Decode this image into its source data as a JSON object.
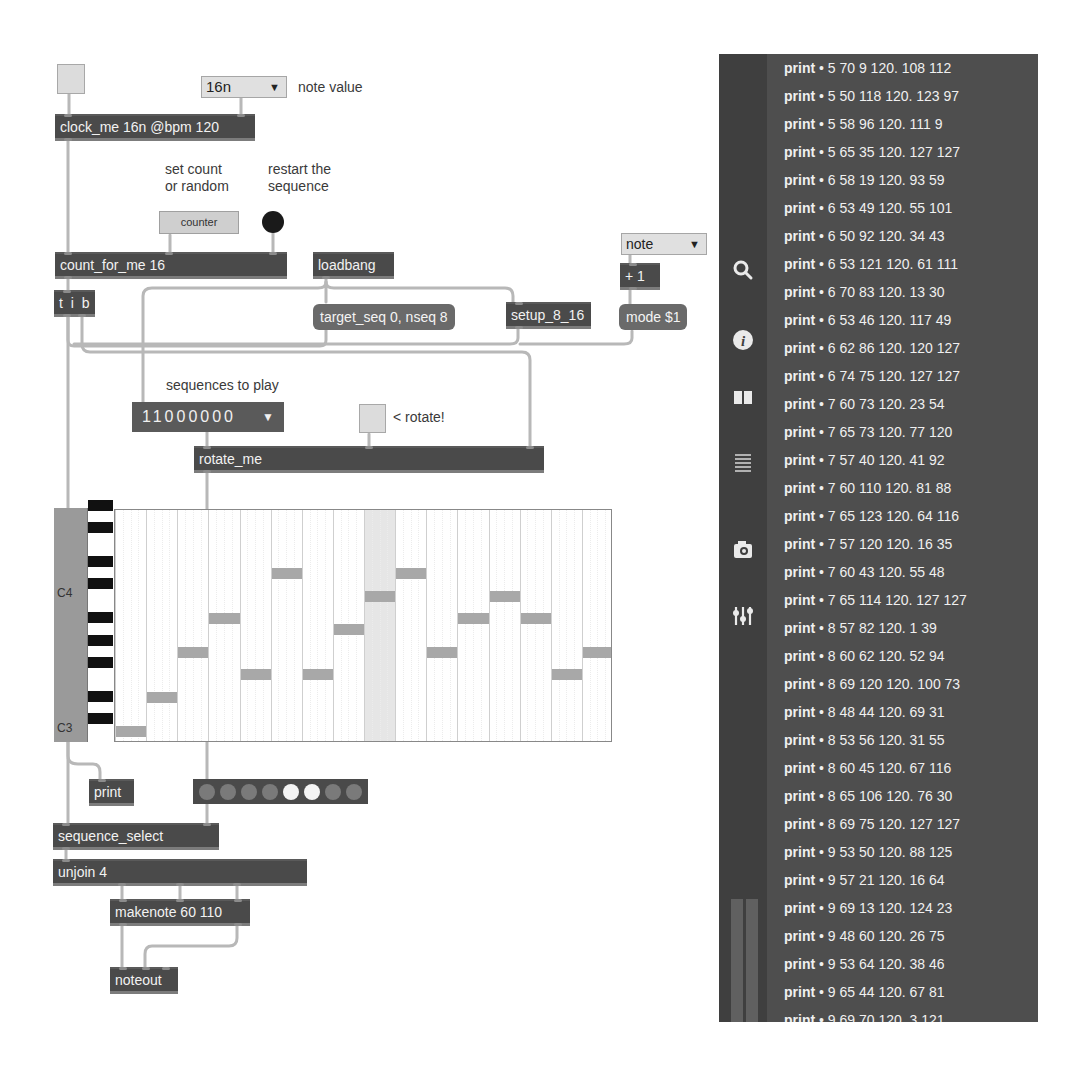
{
  "patch": {
    "toggle_top": {},
    "note_value_menu": {
      "value": "16n",
      "comment": "note value"
    },
    "clock": {
      "text": "clock_me 16n @bpm 120"
    },
    "comments": {
      "set_count": "set count\nor random",
      "set_count_l1": "set count",
      "set_count_l2": "or random",
      "restart_l1": "restart the",
      "restart_l2": "sequence",
      "sequences_to_play": "sequences to play",
      "rotate": "< rotate!"
    },
    "counter_button": {
      "label": "counter"
    },
    "count_for_me": {
      "text": "count_for_me 16"
    },
    "loadbang": {
      "text": "loadbang"
    },
    "mode_menu": {
      "value": "note"
    },
    "plus_one": {
      "text": "+ 1"
    },
    "tib": {
      "text": "t i b"
    },
    "target_seq_msg": {
      "text": "target_seq 0, nseq 8"
    },
    "setup": {
      "text": "setup_8_16"
    },
    "mode_msg": {
      "text": "mode $1"
    },
    "sequences_menu": {
      "value": "11000000"
    },
    "rotate_me": {
      "text": "rotate_me"
    },
    "piano_roll": {
      "label_c4": "C4",
      "label_c3": "C3",
      "columns": 16,
      "highlight_column": 9,
      "notes": [
        48,
        51,
        55,
        58,
        53,
        62,
        53,
        57,
        60,
        62,
        55,
        58,
        60,
        58,
        53,
        55
      ]
    },
    "print": {
      "text": "print"
    },
    "leds": [
      false,
      false,
      false,
      false,
      true,
      true,
      false,
      false
    ],
    "sequence_select": {
      "text": "sequence_select"
    },
    "unjoin": {
      "text": "unjoin 4"
    },
    "makenote": {
      "text": "makenote 60 110"
    },
    "noteout": {
      "text": "noteout"
    }
  },
  "console": {
    "sidebar_icons": [
      "search-icon",
      "info-icon",
      "reference-icon",
      "list-icon",
      "snapshot-icon",
      "mixer-icon"
    ],
    "rows": [
      {
        "source": "print",
        "msg": "5 70 9 120. 108 112"
      },
      {
        "source": "print",
        "msg": "5 50 118 120. 123 97"
      },
      {
        "source": "print",
        "msg": "5 58 96 120. 111 9"
      },
      {
        "source": "print",
        "msg": "5 65 35 120. 127 127"
      },
      {
        "source": "print",
        "msg": "6 58 19 120. 93 59"
      },
      {
        "source": "print",
        "msg": "6 53 49 120. 55 101"
      },
      {
        "source": "print",
        "msg": "6 50 92 120. 34 43"
      },
      {
        "source": "print",
        "msg": "6 53 121 120. 61 111"
      },
      {
        "source": "print",
        "msg": "6 70 83 120. 13 30"
      },
      {
        "source": "print",
        "msg": "6 53 46 120. 117 49"
      },
      {
        "source": "print",
        "msg": "6 62 86 120. 120 127"
      },
      {
        "source": "print",
        "msg": "6 74 75 120. 127 127"
      },
      {
        "source": "print",
        "msg": "7 60 73 120. 23 54"
      },
      {
        "source": "print",
        "msg": "7 65 73 120. 77 120"
      },
      {
        "source": "print",
        "msg": "7 57 40 120. 41 92"
      },
      {
        "source": "print",
        "msg": "7 60 110 120. 81 88"
      },
      {
        "source": "print",
        "msg": "7 65 123 120. 64 116"
      },
      {
        "source": "print",
        "msg": "7 57 120 120. 16 35"
      },
      {
        "source": "print",
        "msg": "7 60 43 120. 55 48"
      },
      {
        "source": "print",
        "msg": "7 65 114 120. 127 127"
      },
      {
        "source": "print",
        "msg": "8 57 82 120. 1 39"
      },
      {
        "source": "print",
        "msg": "8 60 62 120. 52 94"
      },
      {
        "source": "print",
        "msg": "8 69 120 120. 100 73"
      },
      {
        "source": "print",
        "msg": "8 48 44 120. 69 31"
      },
      {
        "source": "print",
        "msg": "8 53 56 120. 31 55"
      },
      {
        "source": "print",
        "msg": "8 60 45 120. 67 116"
      },
      {
        "source": "print",
        "msg": "8 65 106 120. 76 30"
      },
      {
        "source": "print",
        "msg": "8 69 75 120. 127 127"
      },
      {
        "source": "print",
        "msg": "9 53 50 120. 88 125"
      },
      {
        "source": "print",
        "msg": "9 57 21 120. 16 64"
      },
      {
        "source": "print",
        "msg": "9 69 13 120. 124 23"
      },
      {
        "source": "print",
        "msg": "9 48 60 120. 26 75"
      },
      {
        "source": "print",
        "msg": "9 53 64 120. 38 46"
      },
      {
        "source": "print",
        "msg": "9 65 44 120. 67 81"
      },
      {
        "source": "print",
        "msg": "9 69 70 120. 3 121"
      }
    ]
  },
  "colors": {
    "object_bg": "#4a4a4a",
    "message_bg": "#6a6a6a",
    "console_bg": "#4e4e4e",
    "console_rail": "#3f3f3f",
    "note": "#a8a8a8",
    "cord": "#b8b8b8"
  }
}
